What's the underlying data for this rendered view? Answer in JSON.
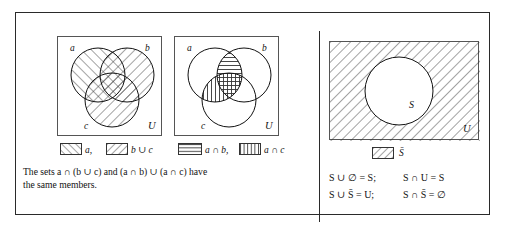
{
  "figure": {
    "panels": [
      {
        "id": "panel-left",
        "diagram": {
          "name": "venn-three-set-shaded",
          "set_labels": [
            "a",
            "b",
            "c"
          ],
          "universe_label": "U",
          "shading": [
            {
              "region": "a",
              "pattern": "backslash-hatch",
              "description": "set a hatched with backslash lines"
            },
            {
              "region": "b-union-c",
              "pattern": "slash-hatch",
              "description": "b union c hatched with forward slash lines"
            }
          ]
        },
        "key": [
          {
            "swatch": "backslash-hatch",
            "label": "a,"
          },
          {
            "swatch": "slash-hatch",
            "label": "b ∪ c"
          }
        ]
      },
      {
        "id": "panel-middle",
        "diagram": {
          "name": "venn-three-set-intersections",
          "set_labels": [
            "a",
            "b",
            "c"
          ],
          "universe_label": "U",
          "shading": [
            {
              "region": "a-intersect-b",
              "pattern": "horizontal-lines",
              "description": "a intersect b lens filled with horizontal lines"
            },
            {
              "region": "a-intersect-c",
              "pattern": "vertical-lines",
              "description": "a intersect c lens filled with vertical lines"
            }
          ]
        },
        "key": [
          {
            "swatch": "horizontal-lines",
            "label": "a ∩ b,"
          },
          {
            "swatch": "vertical-lines",
            "label": "a ∩ c"
          }
        ]
      },
      {
        "id": "panel-right",
        "diagram": {
          "name": "venn-complement-shaded",
          "set_labels": [
            "S"
          ],
          "universe_label": "U",
          "shading": [
            {
              "region": "complement-of-S",
              "pattern": "slash-hatch",
              "description": "everything in U outside S is hatched"
            }
          ]
        },
        "key": [
          {
            "swatch": "slash-hatch",
            "label": "S̄"
          }
        ]
      }
    ],
    "caption": {
      "line1": "The sets a ∩ (b ∪ c) and (a ∩ b) ∪ (a ∩ c) have",
      "line2": "the same members."
    },
    "laws": [
      {
        "left": "S ∪ ∅ = S;",
        "right": "S ∩ U = S"
      },
      {
        "left": "S ∪ S̄ = U;",
        "right": "S ∩ S̄ = ∅"
      }
    ]
  },
  "colors": {
    "ink": "#111111",
    "frame": "#2a2a2a",
    "box_border": "#555555",
    "hatch": "#333333",
    "background": "#ffffff"
  }
}
